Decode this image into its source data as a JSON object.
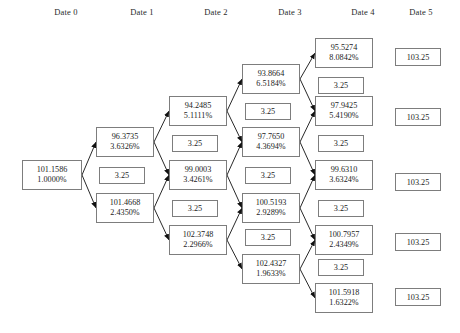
{
  "headers": [
    {
      "label": "Date 0",
      "cx": 66
    },
    {
      "label": "Date 1",
      "cx": 142
    },
    {
      "label": "Date 2",
      "cx": 216
    },
    {
      "label": "Date 3",
      "cx": 290
    },
    {
      "label": "Date 4",
      "cx": 363
    },
    {
      "label": "Date 5",
      "cx": 421
    }
  ],
  "tree": {
    "type": "binomial-lattice",
    "coupon_label": "3.25",
    "terminal_label": "103.25",
    "columns": [
      {
        "date": "Date 0",
        "nodes": [
          {
            "price": "101.1586",
            "rate": "1.0000%",
            "x": 22,
            "y": 160,
            "w": 60,
            "h": 30
          }
        ],
        "coupons": []
      },
      {
        "date": "Date 1",
        "nodes": [
          {
            "price": "96.3735",
            "rate": "3.6326%",
            "x": 96,
            "y": 127,
            "w": 58,
            "h": 30
          },
          {
            "price": "101.4668",
            "rate": "2.4350%",
            "x": 96,
            "y": 193,
            "w": 58,
            "h": 30
          }
        ],
        "coupons": [
          {
            "value": "3.25",
            "x": 99,
            "y": 167,
            "w": 46,
            "h": 17
          }
        ]
      },
      {
        "date": "Date 2",
        "nodes": [
          {
            "price": "94.2485",
            "rate": "5.1111%",
            "x": 169,
            "y": 96,
            "w": 58,
            "h": 30
          },
          {
            "price": "99.0003",
            "rate": "3.4261%",
            "x": 169,
            "y": 160,
            "w": 58,
            "h": 30
          },
          {
            "price": "102.3748",
            "rate": "2.2966%",
            "x": 169,
            "y": 225,
            "w": 58,
            "h": 30
          }
        ],
        "coupons": [
          {
            "value": "3.25",
            "x": 172,
            "y": 135,
            "w": 46,
            "h": 17
          },
          {
            "value": "3.25",
            "x": 172,
            "y": 200,
            "w": 46,
            "h": 17
          }
        ]
      },
      {
        "date": "Date 3",
        "nodes": [
          {
            "price": "93.8664",
            "rate": "6.5184%",
            "x": 242,
            "y": 64,
            "w": 58,
            "h": 30
          },
          {
            "price": "97.7650",
            "rate": "4.3694%",
            "x": 242,
            "y": 127,
            "w": 58,
            "h": 30
          },
          {
            "price": "100.5193",
            "rate": "2.9289%",
            "x": 242,
            "y": 193,
            "w": 58,
            "h": 30
          },
          {
            "price": "102.4327",
            "rate": "1.9633%",
            "x": 242,
            "y": 254,
            "w": 58,
            "h": 30
          }
        ],
        "coupons": [
          {
            "value": "3.25",
            "x": 245,
            "y": 103,
            "w": 46,
            "h": 17
          },
          {
            "value": "3.25",
            "x": 245,
            "y": 167,
            "w": 46,
            "h": 17
          },
          {
            "value": "3.25",
            "x": 245,
            "y": 229,
            "w": 46,
            "h": 17
          }
        ]
      },
      {
        "date": "Date 4",
        "nodes": [
          {
            "price": "95.5274",
            "rate": "8.0842%",
            "x": 315,
            "y": 38,
            "w": 58,
            "h": 30
          },
          {
            "price": "97.9425",
            "rate": "5.4190%",
            "x": 315,
            "y": 96,
            "w": 58,
            "h": 30
          },
          {
            "price": "99.6310",
            "rate": "3.6324%",
            "x": 315,
            "y": 160,
            "w": 58,
            "h": 30
          },
          {
            "price": "100.7957",
            "rate": "2.4349%",
            "x": 315,
            "y": 225,
            "w": 58,
            "h": 30
          },
          {
            "price": "101.5918",
            "rate": "1.6322%",
            "x": 315,
            "y": 283,
            "w": 58,
            "h": 30
          }
        ],
        "coupons": [
          {
            "value": "3.25",
            "x": 318,
            "y": 77,
            "w": 46,
            "h": 17
          },
          {
            "value": "3.25",
            "x": 318,
            "y": 135,
            "w": 46,
            "h": 17
          },
          {
            "value": "3.25",
            "x": 318,
            "y": 200,
            "w": 46,
            "h": 17
          },
          {
            "value": "3.25",
            "x": 318,
            "y": 259,
            "w": 46,
            "h": 17
          }
        ]
      },
      {
        "date": "Date 5",
        "nodes": [],
        "coupons": [],
        "terminals": [
          {
            "value": "103.25",
            "x": 395,
            "y": 48,
            "w": 46,
            "h": 18
          },
          {
            "value": "103.25",
            "x": 395,
            "y": 108,
            "w": 46,
            "h": 18
          },
          {
            "value": "103.25",
            "x": 395,
            "y": 173,
            "w": 46,
            "h": 18
          },
          {
            "value": "103.25",
            "x": 395,
            "y": 233,
            "w": 46,
            "h": 18
          },
          {
            "value": "103.25",
            "x": 395,
            "y": 288,
            "w": 46,
            "h": 18
          }
        ]
      }
    ],
    "edges": [
      {
        "from": [
          82,
          175
        ],
        "to": [
          96,
          142
        ]
      },
      {
        "from": [
          82,
          175
        ],
        "to": [
          96,
          208
        ]
      },
      {
        "from": [
          154,
          142
        ],
        "to": [
          169,
          111
        ]
      },
      {
        "from": [
          154,
          142
        ],
        "to": [
          169,
          175
        ]
      },
      {
        "from": [
          154,
          208
        ],
        "to": [
          169,
          175
        ]
      },
      {
        "from": [
          154,
          208
        ],
        "to": [
          169,
          240
        ]
      },
      {
        "from": [
          227,
          111
        ],
        "to": [
          242,
          79
        ]
      },
      {
        "from": [
          227,
          111
        ],
        "to": [
          242,
          142
        ]
      },
      {
        "from": [
          227,
          175
        ],
        "to": [
          242,
          142
        ]
      },
      {
        "from": [
          227,
          175
        ],
        "to": [
          242,
          208
        ]
      },
      {
        "from": [
          227,
          240
        ],
        "to": [
          242,
          208
        ]
      },
      {
        "from": [
          227,
          240
        ],
        "to": [
          242,
          269
        ]
      },
      {
        "from": [
          300,
          79
        ],
        "to": [
          315,
          53
        ]
      },
      {
        "from": [
          300,
          79
        ],
        "to": [
          315,
          111
        ]
      },
      {
        "from": [
          300,
          142
        ],
        "to": [
          315,
          111
        ]
      },
      {
        "from": [
          300,
          142
        ],
        "to": [
          315,
          175
        ]
      },
      {
        "from": [
          300,
          208
        ],
        "to": [
          315,
          175
        ]
      },
      {
        "from": [
          300,
          208
        ],
        "to": [
          315,
          240
        ]
      },
      {
        "from": [
          300,
          269
        ],
        "to": [
          315,
          240
        ]
      },
      {
        "from": [
          300,
          269
        ],
        "to": [
          315,
          298
        ]
      }
    ]
  }
}
